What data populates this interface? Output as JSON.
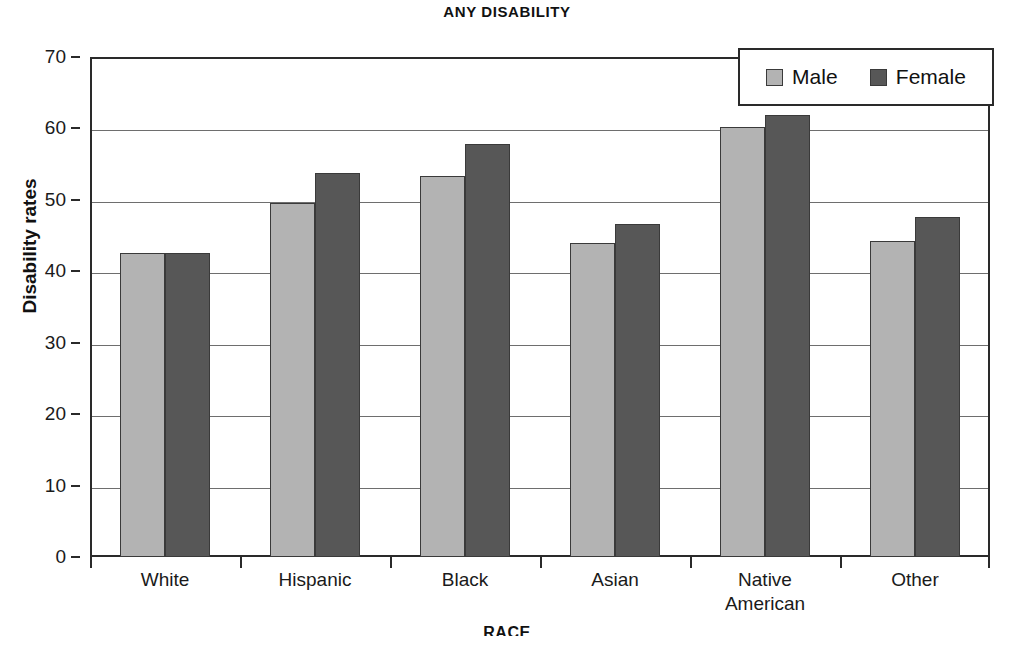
{
  "chart_data": {
    "type": "bar",
    "title": "ANY DISABILITY",
    "xlabel": "RACE",
    "ylabel": "Disability rates",
    "categories": [
      "White",
      "Hispanic",
      "Black",
      "Asian",
      "Native\nAmerican",
      "Other"
    ],
    "series": [
      {
        "name": "Male",
        "color": "#b3b3b3",
        "values": [
          42.5,
          49.5,
          53.4,
          44.0,
          60.2,
          44.3
        ]
      },
      {
        "name": "Female",
        "color": "#575757",
        "values": [
          42.5,
          53.7,
          57.8,
          46.6,
          61.9,
          47.6
        ]
      }
    ],
    "ylim": [
      0,
      70
    ],
    "yticks": [
      0,
      10,
      20,
      30,
      40,
      50,
      60,
      70
    ],
    "ytick_labels": [
      "0",
      "10",
      "20",
      "30",
      "40",
      "50",
      "60",
      "70"
    ],
    "grid": true,
    "grid_axis": "y",
    "legend_position": "top-right",
    "legend_entries": [
      "Male",
      "Female"
    ]
  }
}
